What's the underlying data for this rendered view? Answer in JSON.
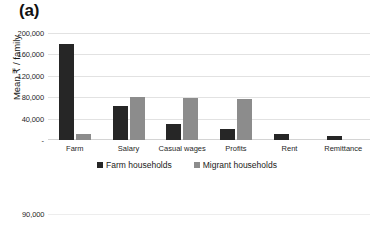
{
  "figure": {
    "panel_a_tag": "(a)",
    "panel_b_tag": "(b)"
  },
  "chart_data": {
    "type": "bar",
    "title": "",
    "xlabel": "",
    "ylabel": "Mean ₹ / family",
    "ylim": [
      0,
      200000
    ],
    "yticks": [
      "-",
      "40,000",
      "80,000",
      "120,000",
      "160,000",
      "200,000"
    ],
    "ytick_values": [
      0,
      40000,
      80000,
      120000,
      160000,
      200000
    ],
    "grid": true,
    "legend_position": "bottom",
    "categories": [
      "Farm",
      "Salary",
      "Casual wages",
      "Profits",
      "Rent",
      "Remittance"
    ],
    "series": [
      {
        "name": "Farm households",
        "color": "#262626",
        "values": [
          180000,
          64000,
          30000,
          20000,
          12000,
          7000
        ]
      },
      {
        "name": "Migrant households",
        "color": "#8c8c8c",
        "values": [
          12000,
          81000,
          78000,
          77000,
          0,
          0
        ]
      }
    ]
  },
  "panel_b": {
    "yticks": [
      "90,000"
    ]
  }
}
